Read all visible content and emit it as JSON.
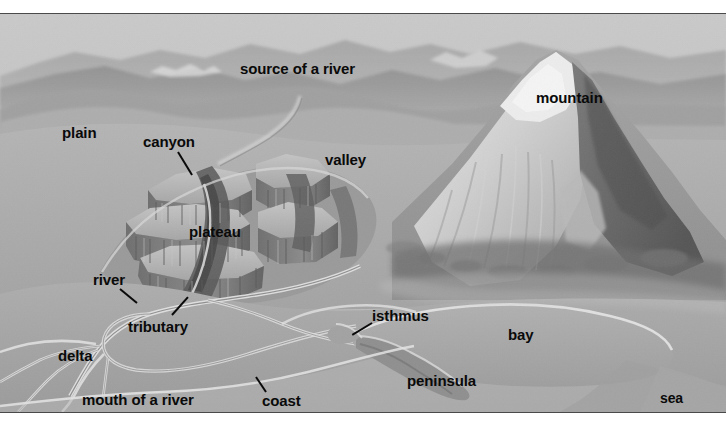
{
  "figure": {
    "kind": "landform-diagram",
    "background_color": "#a9a9a9",
    "label_color": "#0a0a0a",
    "plate_border_color": "#4a4a4a"
  },
  "labels": [
    {
      "id": "source-of-a-river",
      "text": "source of a river",
      "x": 240,
      "y": 47,
      "size": 15,
      "leader": null
    },
    {
      "id": "mountain",
      "text": "mountain",
      "x": 536,
      "y": 76,
      "size": 15,
      "leader": null
    },
    {
      "id": "plain",
      "text": "plain",
      "x": 62,
      "y": 111,
      "size": 15,
      "leader": null
    },
    {
      "id": "canyon",
      "text": "canyon",
      "x": 143,
      "y": 120,
      "size": 15,
      "leader": {
        "x1": 178,
        "y1": 137,
        "x2": 192,
        "y2": 160
      }
    },
    {
      "id": "valley",
      "text": "valley",
      "x": 325,
      "y": 138,
      "size": 15,
      "leader": null
    },
    {
      "id": "plateau",
      "text": "plateau",
      "x": 189,
      "y": 210,
      "size": 15,
      "leader": null
    },
    {
      "id": "river",
      "text": "river",
      "x": 93,
      "y": 258,
      "size": 15,
      "leader": {
        "x1": 120,
        "y1": 274,
        "x2": 137,
        "y2": 288
      }
    },
    {
      "id": "isthmus",
      "text": "isthmus",
      "x": 372,
      "y": 294,
      "size": 15,
      "leader": {
        "x1": 372,
        "y1": 308,
        "x2": 352,
        "y2": 320
      }
    },
    {
      "id": "tributary",
      "text": "tributary",
      "x": 128,
      "y": 305,
      "size": 15,
      "leader": {
        "x1": 172,
        "y1": 300,
        "x2": 188,
        "y2": 282
      }
    },
    {
      "id": "bay",
      "text": "bay",
      "x": 508,
      "y": 313,
      "size": 15,
      "leader": null
    },
    {
      "id": "delta",
      "text": "delta",
      "x": 58,
      "y": 334,
      "size": 15,
      "leader": null
    },
    {
      "id": "peninsula",
      "text": "peninsula",
      "x": 407,
      "y": 359,
      "size": 15,
      "leader": null
    },
    {
      "id": "coast",
      "text": "coast",
      "x": 262,
      "y": 379,
      "size": 15,
      "leader": {
        "x1": 266,
        "y1": 377,
        "x2": 256,
        "y2": 362
      }
    },
    {
      "id": "mouth-of-a-river",
      "text": "mouth of a river",
      "x": 82,
      "y": 378,
      "size": 15,
      "leader": null
    },
    {
      "id": "sea",
      "text": "sea",
      "x": 660,
      "y": 377,
      "size": 14,
      "leader": null
    }
  ]
}
